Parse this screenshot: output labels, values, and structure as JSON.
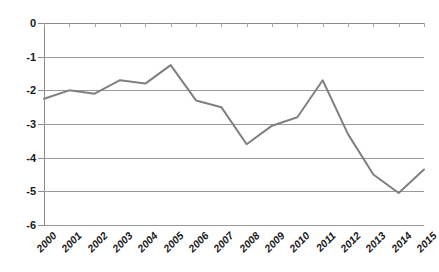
{
  "chart_data": {
    "type": "line",
    "title": "",
    "subtitle": "",
    "xlabel": "",
    "ylabel": "",
    "categories": [
      "2000",
      "2001",
      "2002",
      "2003",
      "2004",
      "2005",
      "2006",
      "2007",
      "2008",
      "2009",
      "2010",
      "2011",
      "2012",
      "2013",
      "2014",
      "2015"
    ],
    "values": [
      -2.25,
      -2.0,
      -2.1,
      -1.7,
      -1.8,
      -1.25,
      -2.3,
      -2.5,
      -3.6,
      -3.05,
      -2.8,
      -1.7,
      -3.3,
      -4.5,
      -5.05,
      -4.35
    ],
    "series": [
      {
        "name": "",
        "values": [
          -2.25,
          -2.0,
          -2.1,
          -1.7,
          -1.8,
          -1.25,
          -2.3,
          -2.5,
          -3.6,
          -3.05,
          -2.8,
          -1.7,
          -3.3,
          -4.5,
          -5.05,
          -4.35
        ]
      }
    ],
    "ylim": [
      -6,
      0
    ],
    "ytick_labels": [
      "0",
      "-1",
      "-2",
      "-3",
      "-4",
      "-5",
      "-6"
    ],
    "ytick_values": [
      0,
      -1,
      -2,
      -3,
      -4,
      -5,
      -6
    ],
    "grid": true,
    "grid_axis": "y",
    "legend": false,
    "legend_position": "none",
    "annotations": [],
    "colors": {
      "line": "#808080",
      "grid": "#9a9a9a",
      "axis": "#8c8c8c",
      "text": "#1a1a1a",
      "background": "#ffffff"
    },
    "line_width": 2
  }
}
